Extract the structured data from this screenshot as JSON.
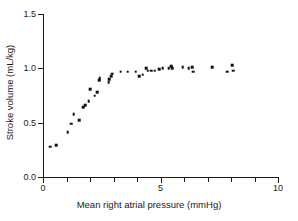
{
  "chart_data": {
    "type": "scatter",
    "title": "",
    "xlabel": "Mean right atrial pressure (mmHg)",
    "ylabel": "Stroke volume (mL/kg)",
    "xlim": [
      0,
      10
    ],
    "ylim": [
      0.0,
      1.5
    ],
    "grid": false,
    "legend": null,
    "x_ticks": [
      0,
      1,
      2,
      3,
      4,
      5,
      6,
      7,
      8,
      9,
      10
    ],
    "x_tick_labels": [
      "0",
      "",
      "",
      "",
      "",
      "5",
      "",
      "",
      "",
      "",
      "10"
    ],
    "y_ticks": [
      0.0,
      0.5,
      1.0,
      1.5
    ],
    "y_tick_labels": [
      "0.0",
      "0.5",
      "1.0",
      "1.5"
    ],
    "marker": "square",
    "marker_color": "#111111",
    "points": [
      {
        "x": 0.3,
        "y": 0.28
      },
      {
        "x": 0.55,
        "y": 0.29
      },
      {
        "x": 1.05,
        "y": 0.41
      },
      {
        "x": 1.2,
        "y": 0.49
      },
      {
        "x": 1.3,
        "y": 0.58
      },
      {
        "x": 1.55,
        "y": 0.52
      },
      {
        "x": 1.7,
        "y": 0.64
      },
      {
        "x": 1.8,
        "y": 0.66
      },
      {
        "x": 1.95,
        "y": 0.7
      },
      {
        "x": 2.0,
        "y": 0.81
      },
      {
        "x": 2.2,
        "y": 0.75
      },
      {
        "x": 2.3,
        "y": 0.78
      },
      {
        "x": 2.4,
        "y": 0.89
      },
      {
        "x": 2.42,
        "y": 0.91
      },
      {
        "x": 2.8,
        "y": 0.87
      },
      {
        "x": 2.82,
        "y": 0.9
      },
      {
        "x": 2.9,
        "y": 0.93
      },
      {
        "x": 2.95,
        "y": 0.95
      },
      {
        "x": 3.3,
        "y": 0.97
      },
      {
        "x": 3.6,
        "y": 0.97
      },
      {
        "x": 3.95,
        "y": 0.97
      },
      {
        "x": 4.1,
        "y": 0.93
      },
      {
        "x": 4.25,
        "y": 0.94
      },
      {
        "x": 4.4,
        "y": 1.0
      },
      {
        "x": 4.45,
        "y": 0.98
      },
      {
        "x": 4.6,
        "y": 0.98
      },
      {
        "x": 4.75,
        "y": 0.98
      },
      {
        "x": 4.95,
        "y": 0.99
      },
      {
        "x": 5.1,
        "y": 1.0
      },
      {
        "x": 5.35,
        "y": 1.0
      },
      {
        "x": 5.45,
        "y": 1.02
      },
      {
        "x": 5.5,
        "y": 1.0
      },
      {
        "x": 5.95,
        "y": 1.01
      },
      {
        "x": 6.2,
        "y": 1.0
      },
      {
        "x": 6.35,
        "y": 1.01
      },
      {
        "x": 6.4,
        "y": 0.97
      },
      {
        "x": 7.2,
        "y": 1.01
      },
      {
        "x": 7.85,
        "y": 0.97
      },
      {
        "x": 8.05,
        "y": 1.03
      },
      {
        "x": 8.1,
        "y": 0.98
      }
    ]
  }
}
